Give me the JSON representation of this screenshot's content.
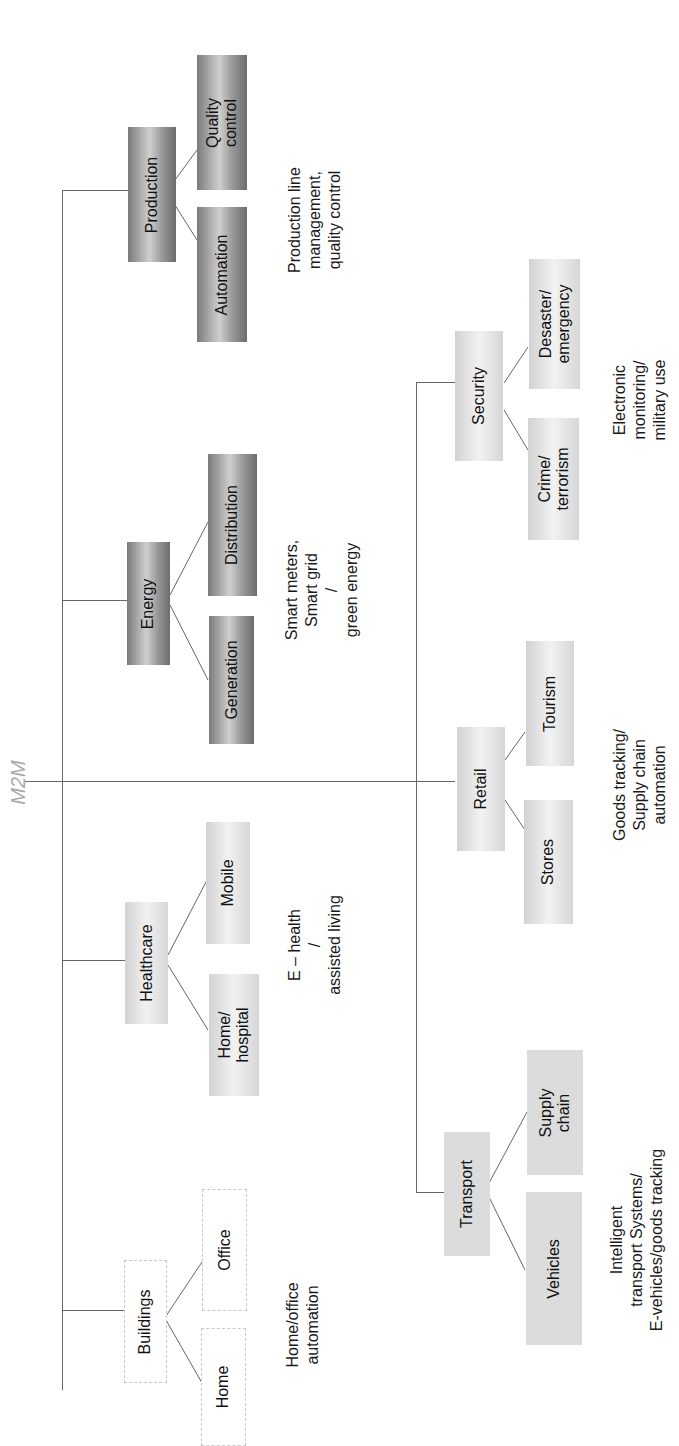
{
  "diagram": {
    "root": "M2M",
    "orientation": "rotated 90° counter-clockwise",
    "branches": [
      {
        "id": "production",
        "label": "Production",
        "children": [
          "Automation",
          "Quality\ncontrol"
        ],
        "description": "Production line\nmanagement,\nquality control",
        "style": "dark"
      },
      {
        "id": "energy",
        "label": "Energy",
        "children": [
          "Generation",
          "Distribution"
        ],
        "description": "Smart meters,\nSmart grid\n/\ngreen energy",
        "style": "dark"
      },
      {
        "id": "healthcare",
        "label": "Healthcare",
        "children": [
          "Home/\nhospital",
          "Mobile"
        ],
        "description": "E – health\n/\nassisted living",
        "style": "light"
      },
      {
        "id": "buildings",
        "label": "Buildings",
        "children": [
          "Home",
          "Office"
        ],
        "description": "Home/office\nautomation",
        "style": "outline"
      },
      {
        "id": "security",
        "label": "Security",
        "children": [
          "Crime/\nterrorism",
          "Desaster/\nemergency"
        ],
        "description": "Electronic\nmonitoring/\nmilitary use",
        "style": "light"
      },
      {
        "id": "retail",
        "label": "Retail",
        "children": [
          "Stores",
          "Tourism"
        ],
        "description": "Goods tracking/\nSupply chain\nautomation",
        "style": "light"
      },
      {
        "id": "transport",
        "label": "Transport",
        "children": [
          "Vehicles",
          "Supply\nchain"
        ],
        "description": "Intelligent\ntransport Systems/\nE-vehicles/goods tracking",
        "style": "flat"
      }
    ]
  },
  "labels": {
    "root": "M2M",
    "production": "Production",
    "automation": "Automation",
    "quality_control": "Quality\ncontrol",
    "production_desc": "Production line\nmanagement,\nquality control",
    "energy": "Energy",
    "generation": "Generation",
    "distribution": "Distribution",
    "energy_desc": "Smart meters,\nSmart grid\n/\ngreen energy",
    "healthcare": "Healthcare",
    "home_hospital": "Home/\nhospital",
    "mobile": "Mobile",
    "healthcare_desc": "E – health\n/\nassisted living",
    "buildings": "Buildings",
    "home": "Home",
    "office": "Office",
    "buildings_desc": "Home/office\nautomation",
    "security": "Security",
    "crime": "Crime/\nterrorism",
    "desaster": "Desaster/\nemergency",
    "security_desc": "Electronic\nmonitoring/\nmilitary use",
    "retail": "Retail",
    "stores": "Stores",
    "tourism": "Tourism",
    "retail_desc": "Goods tracking/\nSupply chain\nautomation",
    "transport": "Transport",
    "vehicles": "Vehicles",
    "supply_chain": "Supply\nchain",
    "transport_desc": "Intelligent\ntransport Systems/\nE-vehicles/goods tracking"
  }
}
